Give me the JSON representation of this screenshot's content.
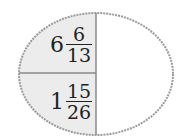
{
  "diagram": {
    "shape": "ellipse",
    "colors": {
      "left_fill": "#ececec",
      "right_fill": "#ffffff",
      "border": "#9a9a9a",
      "divider": "#8a8a8a",
      "text": "#222222"
    },
    "cells": [
      {
        "position": "top-left",
        "whole": "6",
        "numerator": "6",
        "denominator": "13"
      },
      {
        "position": "bottom-left",
        "whole": "1",
        "numerator": "15",
        "denominator": "26"
      },
      {
        "position": "right",
        "content": ""
      }
    ]
  }
}
